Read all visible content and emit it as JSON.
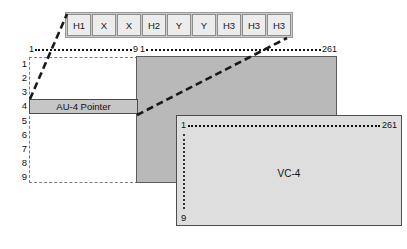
{
  "diagram": {
    "overhead_bytes": [
      {
        "label": "H1"
      },
      {
        "label": "X"
      },
      {
        "label": "X"
      },
      {
        "label": "H2"
      },
      {
        "label": "Y"
      },
      {
        "label": "Y"
      },
      {
        "label": "H3"
      },
      {
        "label": "H3"
      },
      {
        "label": "H3"
      }
    ],
    "left_section": {
      "column_start": "1",
      "column_end": "9",
      "row_numbers": [
        "1",
        "2",
        "3",
        "4",
        "5",
        "6",
        "7",
        "8",
        "9"
      ],
      "pointer_label": "AU-4 Pointer"
    },
    "payload_section": {
      "column_start": "1",
      "column_end": "261"
    },
    "vc4_container": {
      "column_start": "1",
      "column_end": "261",
      "row_end": "9",
      "label": "VC-4"
    },
    "colors": {
      "byte_cell_fill": "#ececec",
      "byte_cell_border": "#8d8d8d",
      "pointer_fill": "#c6c6c6",
      "payload_fill": "#b9b9b9",
      "vc4_fill": "#dedede",
      "line": "#111111"
    }
  }
}
